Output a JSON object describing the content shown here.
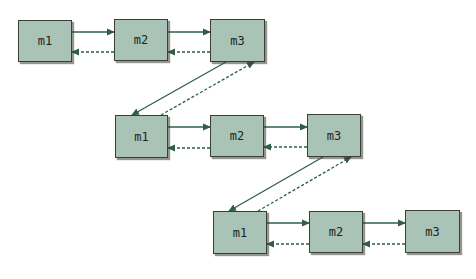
{
  "diagram": {
    "colors": {
      "box_fill": "#a9c3b7",
      "box_border": "#3a3f3c",
      "arrow": "#2f5e47"
    },
    "rows": [
      {
        "id": "row1",
        "nodes": [
          {
            "id": "r1-m1",
            "label": "m1",
            "x": 18,
            "y": 20,
            "w": 54,
            "h": 42
          },
          {
            "id": "r1-m2",
            "label": "m2",
            "x": 114,
            "y": 19,
            "w": 54,
            "h": 42
          },
          {
            "id": "r1-m3",
            "label": "m3",
            "x": 210,
            "y": 19,
            "w": 55,
            "h": 43
          }
        ]
      },
      {
        "id": "row2",
        "nodes": [
          {
            "id": "r2-m1",
            "label": "m1",
            "x": 115,
            "y": 115,
            "w": 53,
            "h": 43
          },
          {
            "id": "r2-m2",
            "label": "m2",
            "x": 210,
            "y": 115,
            "w": 54,
            "h": 42
          },
          {
            "id": "r2-m3",
            "label": "m3",
            "x": 307,
            "y": 114,
            "w": 54,
            "h": 43
          }
        ]
      },
      {
        "id": "row3",
        "nodes": [
          {
            "id": "r3-m1",
            "label": "m1",
            "x": 213,
            "y": 211,
            "w": 54,
            "h": 43
          },
          {
            "id": "r3-m2",
            "label": "m2",
            "x": 309,
            "y": 211,
            "w": 54,
            "h": 42
          },
          {
            "id": "r3-m3",
            "label": "m3",
            "x": 405,
            "y": 210,
            "w": 55,
            "h": 43
          }
        ]
      }
    ],
    "edges": [
      {
        "from": "r1-m1",
        "to": "r1-m2",
        "style": "solid",
        "x1": 72,
        "y1": 32,
        "x2": 114,
        "y2": 32
      },
      {
        "from": "r1-m2",
        "to": "r1-m1",
        "style": "dashed",
        "x1": 114,
        "y1": 52,
        "x2": 72,
        "y2": 52
      },
      {
        "from": "r1-m2",
        "to": "r1-m3",
        "style": "solid",
        "x1": 168,
        "y1": 32,
        "x2": 210,
        "y2": 32
      },
      {
        "from": "r1-m3",
        "to": "r1-m2",
        "style": "dashed",
        "x1": 210,
        "y1": 52,
        "x2": 168,
        "y2": 52
      },
      {
        "from": "r1-m3",
        "to": "r2-m1",
        "style": "solid",
        "x1": 226,
        "y1": 62,
        "x2": 132,
        "y2": 115
      },
      {
        "from": "r2-m1",
        "to": "r1-m3",
        "style": "dashed",
        "x1": 161,
        "y1": 115,
        "x2": 254,
        "y2": 62
      },
      {
        "from": "r2-m1",
        "to": "r2-m2",
        "style": "solid",
        "x1": 168,
        "y1": 127,
        "x2": 210,
        "y2": 127
      },
      {
        "from": "r2-m2",
        "to": "r2-m1",
        "style": "dashed",
        "x1": 210,
        "y1": 148,
        "x2": 168,
        "y2": 148
      },
      {
        "from": "r2-m2",
        "to": "r2-m3",
        "style": "solid",
        "x1": 264,
        "y1": 127,
        "x2": 307,
        "y2": 127
      },
      {
        "from": "r2-m3",
        "to": "r2-m2",
        "style": "dashed",
        "x1": 307,
        "y1": 147,
        "x2": 264,
        "y2": 147
      },
      {
        "from": "r2-m3",
        "to": "r3-m1",
        "style": "solid",
        "x1": 323,
        "y1": 157,
        "x2": 229,
        "y2": 211
      },
      {
        "from": "r3-m1",
        "to": "r2-m3",
        "style": "dashed",
        "x1": 258,
        "y1": 211,
        "x2": 351,
        "y2": 157
      },
      {
        "from": "r3-m1",
        "to": "r3-m2",
        "style": "solid",
        "x1": 267,
        "y1": 223,
        "x2": 309,
        "y2": 223
      },
      {
        "from": "r3-m2",
        "to": "r3-m1",
        "style": "dashed",
        "x1": 309,
        "y1": 244,
        "x2": 267,
        "y2": 244
      },
      {
        "from": "r3-m2",
        "to": "r3-m3",
        "style": "solid",
        "x1": 363,
        "y1": 223,
        "x2": 405,
        "y2": 223
      },
      {
        "from": "r3-m3",
        "to": "r3-m2",
        "style": "dashed",
        "x1": 405,
        "y1": 244,
        "x2": 363,
        "y2": 244
      }
    ]
  }
}
